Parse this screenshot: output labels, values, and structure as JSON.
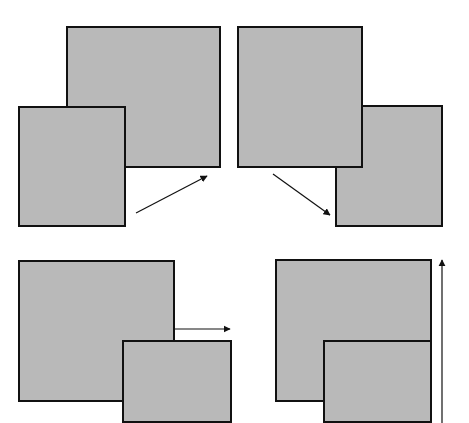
{
  "diagram": {
    "colors": {
      "fill": "#b9b9b9",
      "stroke": "#111111",
      "arrow": "#111111",
      "background": "#ffffff"
    },
    "panels": [
      {
        "id": "top-left",
        "rects": [
          {
            "name": "back-square",
            "x": 66,
            "y": 26,
            "w": 155,
            "h": 142
          },
          {
            "name": "front-square",
            "x": 18,
            "y": 106,
            "w": 108,
            "h": 121
          }
        ],
        "arrow": {
          "direction": "up-right",
          "x1": 136,
          "y1": 213,
          "x2": 207,
          "y2": 176
        }
      },
      {
        "id": "top-right",
        "rects": [
          {
            "name": "front-square",
            "x": 237,
            "y": 26,
            "w": 126,
            "h": 142
          },
          {
            "name": "back-square",
            "x": 335,
            "y": 105,
            "w": 108,
            "h": 122
          }
        ],
        "arrow": {
          "direction": "down-right",
          "x1": 273,
          "y1": 174,
          "x2": 330,
          "y2": 215
        }
      },
      {
        "id": "bottom-left",
        "rects": [
          {
            "name": "back-square",
            "x": 18,
            "y": 260,
            "w": 157,
            "h": 142
          },
          {
            "name": "front-square",
            "x": 122,
            "y": 340,
            "w": 110,
            "h": 83
          }
        ],
        "arrow": {
          "direction": "right",
          "x1": 175,
          "y1": 329,
          "x2": 230,
          "y2": 329
        }
      },
      {
        "id": "bottom-right",
        "rects": [
          {
            "name": "back-square",
            "x": 275,
            "y": 259,
            "w": 157,
            "h": 143
          },
          {
            "name": "front-square",
            "x": 323,
            "y": 340,
            "w": 109,
            "h": 83
          }
        ],
        "arrow": {
          "direction": "up",
          "x1": 442,
          "y1": 423,
          "x2": 442,
          "y2": 260
        }
      }
    ]
  }
}
